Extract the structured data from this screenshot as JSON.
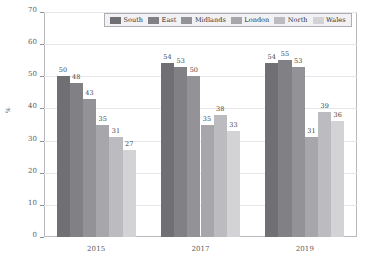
{
  "chart_data": {
    "type": "bar",
    "title": "",
    "xlabel": "",
    "ylabel": "%",
    "ylim": [
      0,
      70
    ],
    "ytick_values": [
      0,
      10,
      20,
      30,
      40,
      50,
      60,
      70
    ],
    "ytick_labels": [
      "0",
      "10",
      "20",
      "30",
      "40",
      "50",
      "60",
      "70"
    ],
    "grid": true,
    "legend_position": "top-center",
    "categories": [
      "2015",
      "2017",
      "2019"
    ],
    "series": [
      {
        "name": "South",
        "color": "#6f6f74",
        "values": [
          50,
          54,
          54
        ]
      },
      {
        "name": "East",
        "color": "#808085",
        "values": [
          48,
          53,
          55
        ]
      },
      {
        "name": "Midlands",
        "color": "#929297",
        "values": [
          43,
          50,
          53
        ]
      },
      {
        "name": "London",
        "color": "#a6a6ab",
        "values": [
          35,
          35,
          31
        ]
      },
      {
        "name": "North",
        "color": "#bcbcc0",
        "values": [
          31,
          38,
          39
        ]
      },
      {
        "name": "Wales",
        "color": "#d3d3d6",
        "values": [
          27,
          33,
          36
        ]
      }
    ]
  },
  "axes": {
    "frame_color": "#b9b9bd",
    "grid_color": "#e6e6ea",
    "tick_color": "#8e8e95",
    "tick_text_color": "#5a5a60"
  },
  "legend": {
    "border_color": "#aeaeb4",
    "background_color": "#f2f2f4"
  }
}
